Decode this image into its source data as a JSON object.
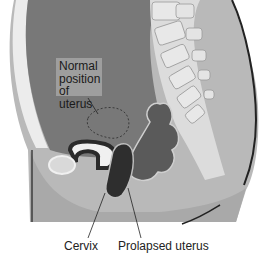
{
  "diagram": {
    "labels": {
      "normal_position": [
        "Normal",
        "position",
        "of uterus"
      ],
      "cervix": "Cervix",
      "prolapsed_uterus": "Prolapsed uterus"
    },
    "colors": {
      "body_outline": "#2a2a2a",
      "abdominal_cavity": "#7a7a7a",
      "skin": "#b8b8b8",
      "bone": "#d9d9d9",
      "organ_dark": "#3a3a3a",
      "background": "#ffffff"
    }
  }
}
